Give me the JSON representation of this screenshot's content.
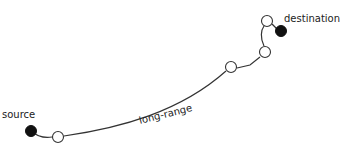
{
  "diagram": {
    "labels": {
      "source": "source",
      "destination": "destination",
      "edge": "long-range"
    },
    "colors": {
      "line": "#333333",
      "node_fill_open": "#ffffff",
      "node_fill_endpoint": "#111111"
    },
    "nodes": [
      {
        "id": "source",
        "x": 31,
        "y": 131,
        "type": "endpoint"
      },
      {
        "id": "n1",
        "x": 58,
        "y": 137,
        "type": "relay"
      },
      {
        "id": "n2",
        "x": 231,
        "y": 67,
        "type": "relay"
      },
      {
        "id": "n3",
        "x": 265,
        "y": 52,
        "type": "relay"
      },
      {
        "id": "n4",
        "x": 267,
        "y": 21,
        "type": "relay"
      },
      {
        "id": "destination",
        "x": 281,
        "y": 31,
        "type": "endpoint"
      }
    ]
  }
}
